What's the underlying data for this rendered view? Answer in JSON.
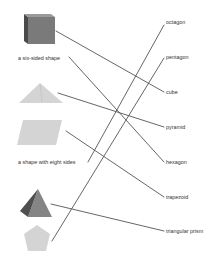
{
  "exercise": {
    "type": "matching",
    "left_items": [
      {
        "id": "cube-image",
        "kind": "image",
        "depicts": "cube",
        "anchor": [
          56,
          31
        ]
      },
      {
        "id": "six-sided-text",
        "kind": "text",
        "label": "a six-sided shape",
        "anchor": [
          69,
          57
        ]
      },
      {
        "id": "triangle-image",
        "kind": "image",
        "depicts": "triangle",
        "anchor": [
          58,
          93
        ]
      },
      {
        "id": "parallelogram-image",
        "kind": "image",
        "depicts": "trapezoid / parallelogram",
        "anchor": [
          66,
          131
        ]
      },
      {
        "id": "eight-sides-text",
        "kind": "text",
        "label": "a shape with eight sides",
        "anchor": [
          88,
          162
        ]
      },
      {
        "id": "pyramid-image",
        "kind": "image",
        "depicts": "pyramid",
        "anchor": [
          51,
          204
        ]
      },
      {
        "id": "pentagon-image",
        "kind": "image",
        "depicts": "pentagon",
        "anchor": [
          52,
          241
        ]
      }
    ],
    "right_items": [
      {
        "label": "octagon",
        "anchor": [
          164,
          24
        ]
      },
      {
        "label": "pentagon",
        "anchor": [
          164,
          58
        ]
      },
      {
        "label": "cube",
        "anchor": [
          164,
          92
        ]
      },
      {
        "label": "pyramid",
        "anchor": [
          164,
          127
        ]
      },
      {
        "label": "hexagon",
        "anchor": [
          164,
          162
        ]
      },
      {
        "label": "trapezoid",
        "anchor": [
          164,
          197
        ]
      },
      {
        "label": "triangular prism",
        "anchor": [
          164,
          231
        ]
      }
    ],
    "connections": [
      {
        "from": "cube-image",
        "to": "cube"
      },
      {
        "from": "six-sided-text",
        "to": "hexagon"
      },
      {
        "from": "triangle-image",
        "to": "pyramid"
      },
      {
        "from": "parallelogram-image",
        "to": "trapezoid"
      },
      {
        "from": "eight-sides-text",
        "to": "octagon"
      },
      {
        "from": "pyramid-image",
        "to": "triangular prism"
      },
      {
        "from": "pentagon-image",
        "to": "pentagon"
      }
    ]
  },
  "left_labels": {
    "six_sided": "a six-sided shape",
    "eight_sides": "a shape with eight sides"
  },
  "right_labels": {
    "octagon": "octagon",
    "pentagon": "pentagon",
    "cube": "cube",
    "pyramid": "pyramid",
    "hexagon": "hexagon",
    "trapezoid": "trapezoid",
    "triangular_prism": "triangular prism"
  },
  "colors": {
    "line": "#555555",
    "text": "#333333",
    "cube_front": "#7a7a7a",
    "cube_side": "#4a4a4a",
    "cube_top": "#9a9a9a",
    "light_shape": "#d4d4d4",
    "pyramid_dark": "#4f4f4f",
    "pyramid_light": "#858585"
  }
}
